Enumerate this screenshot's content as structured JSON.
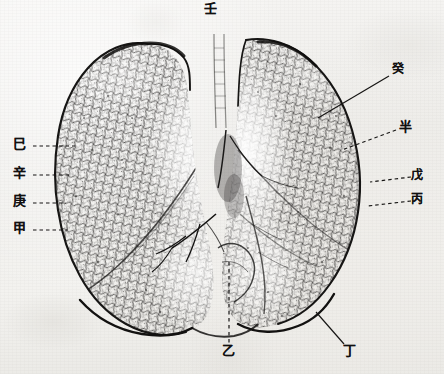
{
  "figure": {
    "kind": "anatomical-illustration",
    "subject": "lungs",
    "title": "Lungs (anterior view) with stem-and-branch reference labels",
    "medium": "halftone engraving on aged paper",
    "width_px": 444,
    "height_px": 374,
    "palette": {
      "paper": "#f2f1ef",
      "paper_highlight": "#f6f5f3",
      "paper_shadow": "#e9e8e4",
      "ink": "#111010",
      "ink_mid": "#3a3836",
      "ink_light": "#6b6864",
      "stipple": "#2b2a28"
    }
  },
  "labels": [
    {
      "id": "top-center",
      "text": "壬",
      "reading": "ren",
      "side": "top",
      "x": 208,
      "y": 8,
      "leader": "dashed-vertical"
    },
    {
      "id": "left-1",
      "text": "巳",
      "reading": "si",
      "side": "left",
      "x": 18,
      "y": 144,
      "leader": "dashed-horizontal"
    },
    {
      "id": "left-2",
      "text": "辛",
      "reading": "xin",
      "side": "left",
      "x": 18,
      "y": 173,
      "leader": "dashed-horizontal"
    },
    {
      "id": "left-3",
      "text": "庚",
      "reading": "geng",
      "side": "left",
      "x": 18,
      "y": 201,
      "leader": "dashed-horizontal"
    },
    {
      "id": "left-4",
      "text": "甲",
      "reading": "jia",
      "side": "left",
      "x": 18,
      "y": 228,
      "leader": "dashed-horizontal"
    },
    {
      "id": "right-1",
      "text": "癸",
      "reading": "gui",
      "side": "right",
      "x": 396,
      "y": 70,
      "leader": "solid-diagonal"
    },
    {
      "id": "right-2",
      "text": "半",
      "reading": "ban",
      "side": "right",
      "x": 404,
      "y": 127,
      "leader": "dashed-diagonal"
    },
    {
      "id": "right-3",
      "text": "戊",
      "reading": "wu",
      "side": "right",
      "x": 416,
      "y": 175,
      "leader": "dashed-horizontal"
    },
    {
      "id": "right-4",
      "text": "丙",
      "reading": "bing",
      "side": "right",
      "x": 416,
      "y": 199,
      "leader": "dashed-horizontal"
    },
    {
      "id": "bottom-center",
      "text": "乙",
      "reading": "yi",
      "side": "bottom",
      "x": 227,
      "y": 351,
      "leader": "dashed-vertical"
    },
    {
      "id": "bottom-right",
      "text": "丁",
      "reading": "ding",
      "side": "bottom",
      "x": 348,
      "y": 351,
      "leader": "solid-diagonal"
    }
  ]
}
